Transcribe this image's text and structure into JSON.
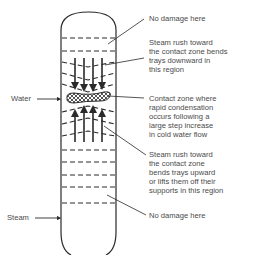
{
  "diagram": {
    "type": "distillation column tray damage schematic",
    "inlets": {
      "water": "Water",
      "steam": "Steam"
    },
    "annotations": [
      {
        "id": "top-no-damage",
        "text": "No damage here"
      },
      {
        "id": "downward-bend",
        "text": "Steam rush toward\nthe contact zone bends\ntrays downward in\nthis region"
      },
      {
        "id": "contact-zone",
        "text": "Contact zone where\nrapid condensation\noccurs following a\nlarge step increase\nin cold water flow"
      },
      {
        "id": "upward-bend",
        "text": "Steam rush toward\nthe contact zone\nbends trays upward\nor lifts them off their\nsupports in this region"
      },
      {
        "id": "bottom-no-damage",
        "text": "No damage here"
      }
    ],
    "colors": {
      "line": "#2a2a2a",
      "text": "#4a4a4a",
      "background": "#ffffff"
    }
  }
}
